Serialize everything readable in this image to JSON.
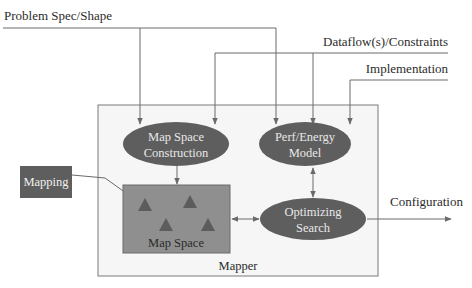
{
  "inputs": {
    "problem": "Problem Spec/Shape",
    "dataflow": "Dataflow(s)/Constraints",
    "implementation": "Implementation"
  },
  "nodes": {
    "map_space_construction": [
      "Map Space",
      "Construction"
    ],
    "perf_energy_model": [
      "Perf/Energy",
      "Model"
    ],
    "optimizing_search": [
      "Optimizing",
      "Search"
    ]
  },
  "boxes": {
    "mapping": "Mapping",
    "map_space": "Map Space",
    "mapper": "Mapper"
  },
  "outputs": {
    "configuration": "Configuration"
  },
  "colors": {
    "ellipse_fill": "#5e5e5e",
    "map_space_fill": "#8f8f8f",
    "triangle_fill": "#5c5c5c",
    "mapper_fill": "#f6f6f6",
    "line": "#6a6a6a"
  }
}
